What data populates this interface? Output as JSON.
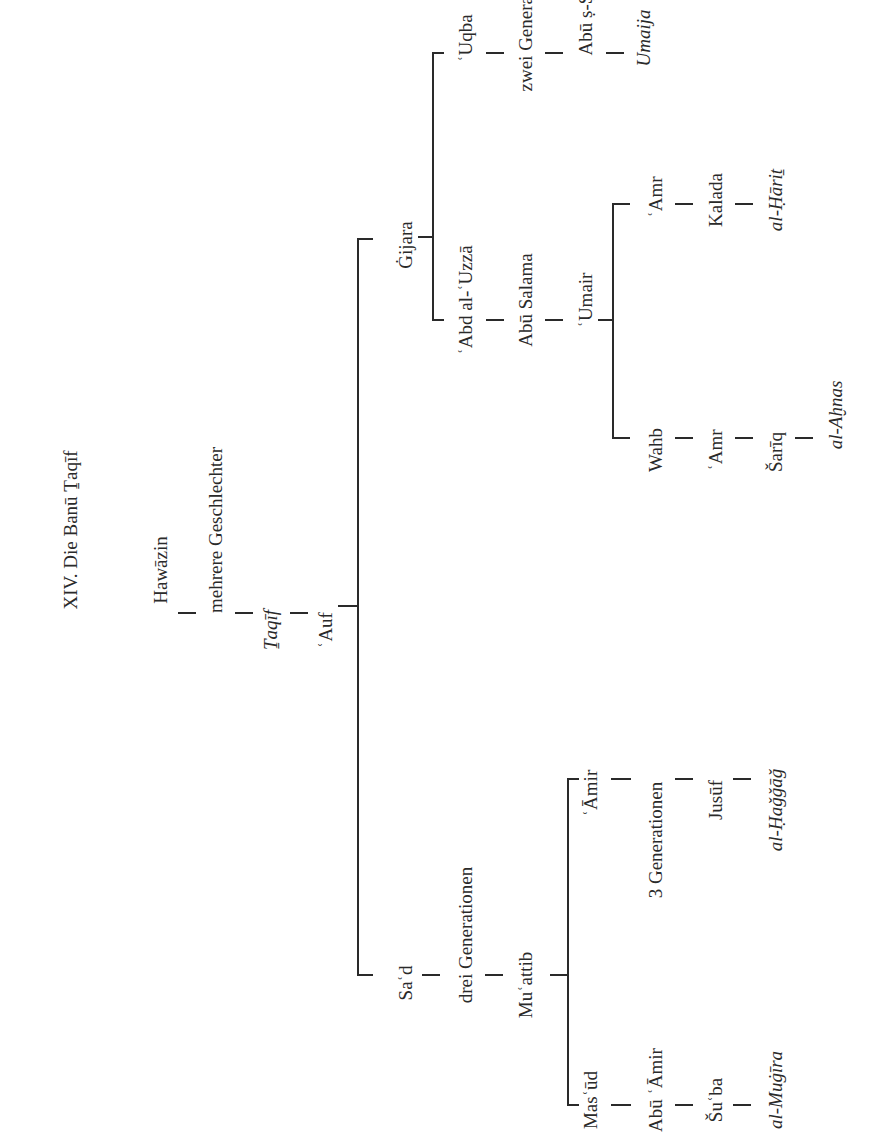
{
  "title": "XIV. Die Banū Ṯaqīf",
  "tree": {
    "root_chain": [
      "Hawāzin",
      "mehrere Geschlechter",
      "Ṯaqīf",
      "ʿAuf"
    ],
    "auf_children": {
      "gijara": {
        "name": "Ġijara",
        "children": {
          "uqba_line": [
            "ʿUqba",
            "zwei Generationen",
            "Abū ṣ-Ṣalt",
            "Umaija"
          ],
          "abd_al_uzza_line": {
            "chain": [
              "ʿAbd al-ʿUzzā",
              "Abū Salama",
              "ʿUmair"
            ],
            "umair_children": {
              "amr_line": [
                "ʿAmr",
                "Kalada",
                "al-Ḥāriṯ"
              ],
              "wahb_line": [
                "Wahb",
                "ʿAmr",
                "Šarīq",
                "al-Aḫnas"
              ]
            }
          }
        }
      },
      "sad": {
        "chain": [
          "Saʿd",
          "drei Generationen",
          "Muʿattib"
        ],
        "muattib_children": {
          "amir_line": [
            "ʿĀmir",
            "3 Generationen",
            "Jusūf",
            "al-Ḥaǧǧāǧ"
          ],
          "masud_line": [
            "Masʿūd",
            "Abū ʿĀmir",
            "Šuʿba",
            "al-Muġīra"
          ]
        }
      }
    }
  }
}
